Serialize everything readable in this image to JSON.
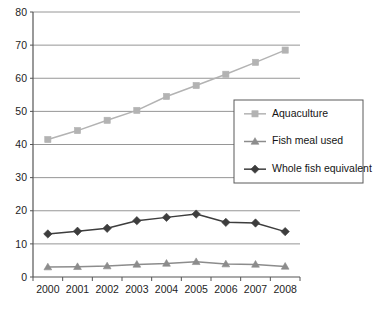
{
  "chart_data": {
    "type": "line",
    "title": "",
    "subtitle": "",
    "xlabel": "",
    "ylabel": "",
    "categories": [
      "2000",
      "2001",
      "2002",
      "2003",
      "2004",
      "2005",
      "2006",
      "2007",
      "2008"
    ],
    "ylim": [
      0,
      80
    ],
    "yticks": [
      0,
      10,
      20,
      30,
      40,
      50,
      60,
      70,
      80
    ],
    "ytick_labels": [
      "0",
      "10",
      "20",
      "30",
      "40",
      "50",
      "60",
      "70",
      "80"
    ],
    "grid": true,
    "grid_axis": "y",
    "legend_position": "center-right",
    "series": [
      {
        "name": "Aquaculture",
        "marker": "square",
        "color": "#b3b3b3",
        "values": [
          41.5,
          44.2,
          47.3,
          50.3,
          54.5,
          57.8,
          61.2,
          64.8,
          68.5
        ]
      },
      {
        "name": "Fish meal used",
        "marker": "triangle",
        "color": "#8c8c8c",
        "values": [
          3.0,
          3.1,
          3.3,
          3.8,
          4.1,
          4.6,
          3.9,
          3.8,
          3.2
        ]
      },
      {
        "name": "Whole fish equivalent",
        "marker": "diamond",
        "color": "#3d3d3d",
        "values": [
          13.0,
          13.8,
          14.7,
          17.0,
          18.0,
          19.0,
          16.5,
          16.3,
          13.7
        ]
      }
    ]
  },
  "legend": {
    "entries": [
      {
        "label": "Aquaculture"
      },
      {
        "label": "Fish meal used"
      },
      {
        "label": "Whole fish equivalent"
      }
    ]
  },
  "colors": {
    "aquaculture": "#b3b3b3",
    "fish_meal_used": "#8c8c8c",
    "whole_fish_equivalent": "#3d3d3d",
    "axis": "#555555",
    "grid": "#8a8a8a",
    "legend_border": "#5a5a5a",
    "background": "#ffffff"
  }
}
